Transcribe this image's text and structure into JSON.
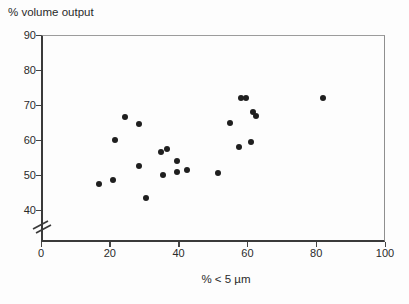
{
  "chart_data": {
    "type": "scatter",
    "title": "",
    "ylabel": "% volume output",
    "xlabel": "% < 5 µm",
    "x_ticks": [
      0,
      20,
      40,
      60,
      80,
      100
    ],
    "y_ticks": [
      90,
      80,
      70,
      60,
      50,
      40
    ],
    "xlim": [
      0,
      100
    ],
    "ylim": [
      40,
      90
    ],
    "y_axis_break": true,
    "grid": false,
    "legend": null,
    "marker": {
      "shape": "circle",
      "size_px": 6,
      "color": "#1f1f1f"
    },
    "points": [
      [
        17,
        47.5
      ],
      [
        21,
        48.5
      ],
      [
        21.5,
        60
      ],
      [
        24.5,
        66.5
      ],
      [
        28.5,
        64.5
      ],
      [
        28.5,
        52.5
      ],
      [
        30.5,
        43.5
      ],
      [
        35,
        56.5
      ],
      [
        36.5,
        57.5
      ],
      [
        35.5,
        50
      ],
      [
        39.5,
        54
      ],
      [
        39.5,
        51
      ],
      [
        42.5,
        51.5
      ],
      [
        51.5,
        50.5
      ],
      [
        55,
        65
      ],
      [
        57.5,
        58
      ],
      [
        58,
        72
      ],
      [
        59.5,
        72
      ],
      [
        61,
        59.5
      ],
      [
        61.5,
        68
      ],
      [
        62.5,
        67
      ],
      [
        82,
        72
      ]
    ]
  },
  "colors": {
    "axis": "#3a3a3a",
    "tick": "#444444",
    "box": "#999999",
    "text": "#2a2a2a",
    "dot": "#1f1f1f",
    "background": "#fdfdfd"
  }
}
